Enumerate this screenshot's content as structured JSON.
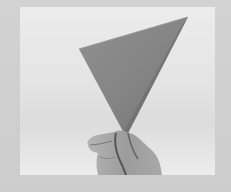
{
  "image": {
    "description": "Black-and-white photograph of a hand holding up a folded paper triangle against a light background, framed by a light gray border",
    "subject": "folded paper triangle held by hand",
    "colors": {
      "border": "#cfcfcf",
      "background": "#e8e8e8",
      "paper": "#8a8a8a",
      "paper_shadow": "#6e6e6e",
      "hand": "#9a9a9a",
      "hand_shadow": "#5a5a5a"
    }
  }
}
